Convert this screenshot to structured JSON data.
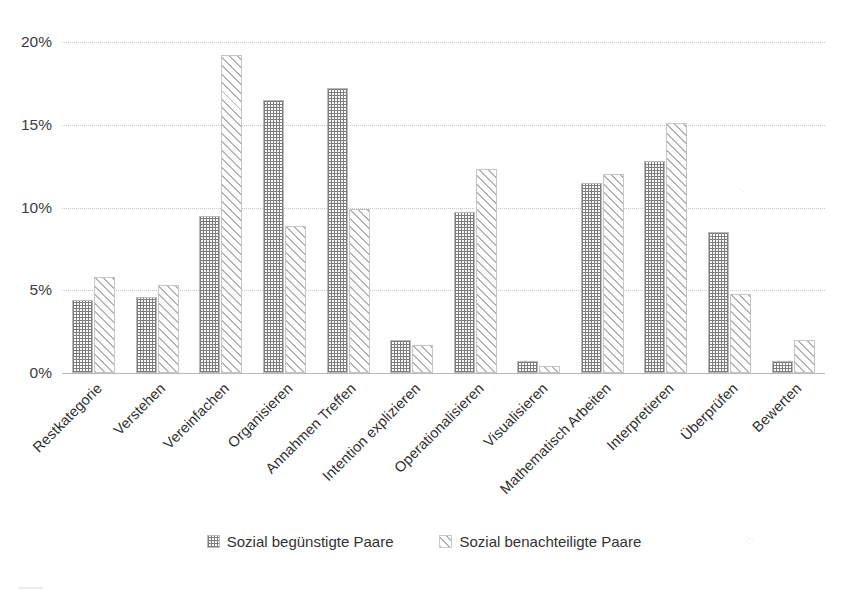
{
  "chart_data": {
    "type": "bar",
    "title": "",
    "xlabel": "",
    "ylabel": "",
    "ylim": [
      0,
      20
    ],
    "ytick_labels": [
      "0%",
      "5%",
      "10%",
      "15%",
      "20%"
    ],
    "ytick_values": [
      0,
      5,
      10,
      15,
      20
    ],
    "grid": true,
    "legend_position": "bottom-center",
    "categories": [
      "Restkategorie",
      "Verstehen",
      "Vereinfachen",
      "Organisieren",
      "Annahmen Treffen",
      "Intention explizieren",
      "Operationalisieren",
      "Visualisieren",
      "Mathematisch Arbeiten",
      "Interpretieren",
      "Überprüfen",
      "Bewerten"
    ],
    "series": [
      {
        "name": "Sozial begünstigte Paare",
        "pattern": "checkered-dots",
        "color": "#7c7c7c",
        "values": [
          4.4,
          4.6,
          9.5,
          16.5,
          17.2,
          2.0,
          9.7,
          0.7,
          11.5,
          12.8,
          8.5,
          0.7
        ]
      },
      {
        "name": "Sozial benachteiligte Paare",
        "pattern": "diagonal-hatch",
        "color": "#b4b4b4",
        "values": [
          5.8,
          5.3,
          19.2,
          8.9,
          9.9,
          1.7,
          12.3,
          0.4,
          12.0,
          15.1,
          4.8,
          2.0
        ]
      }
    ]
  },
  "legend": {
    "items": [
      {
        "label": "Sozial begünstigte Paare"
      },
      {
        "label": "Sozial benachteiligte Paare"
      }
    ]
  }
}
